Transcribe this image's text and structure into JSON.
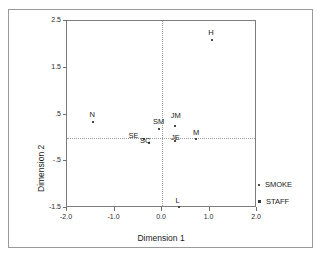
{
  "chart_data": {
    "type": "scatter",
    "title": "",
    "xlabel": "Dimension 1",
    "ylabel": "Dimension 2",
    "xlim": [
      -2.0,
      2.0
    ],
    "ylim": [
      -1.5,
      2.5
    ],
    "xticks": [
      "-2.0",
      "-1.0",
      "0.0",
      "1.0",
      "2.0"
    ],
    "xtick_values": [
      -2.0,
      -1.0,
      0.0,
      1.0,
      2.0
    ],
    "yticks": [
      "2.5",
      "1.5",
      ".5",
      "-.5",
      "-1.5"
    ],
    "ytick_values": [
      2.5,
      1.5,
      0.5,
      -0.5,
      -1.5
    ],
    "grid": false,
    "reference_lines": {
      "x": 0.0,
      "y": 0.0,
      "style": "dotted"
    },
    "legend_position": "right",
    "series": [
      {
        "name": "SMOKE",
        "marker": "dot-small",
        "points": [
          {
            "label": "N",
            "x": -1.45,
            "y": 0.33
          },
          {
            "label": "L",
            "x": 0.35,
            "y": -1.48
          },
          {
            "label": "M",
            "x": 0.72,
            "y": -0.02
          },
          {
            "label": "H",
            "x": 1.05,
            "y": 2.1
          }
        ]
      },
      {
        "name": "STAFF",
        "marker": "dot-small",
        "points": [
          {
            "label": "SM",
            "x": -0.07,
            "y": 0.2
          },
          {
            "label": "JM",
            "x": 0.27,
            "y": 0.25
          },
          {
            "label": "SE",
            "x": -0.37,
            "y": -0.03
          },
          {
            "label": "SC",
            "x": -0.27,
            "y": -0.12
          },
          {
            "label": "JE",
            "x": 0.28,
            "y": -0.06
          }
        ]
      }
    ]
  },
  "legend": {
    "items": [
      {
        "label": "SMOKE"
      },
      {
        "label": "STAFF"
      }
    ]
  }
}
